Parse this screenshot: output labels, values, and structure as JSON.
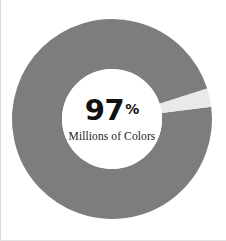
{
  "figure": {
    "background_color": "#ffffff",
    "width": 226,
    "height": 241
  },
  "center": {
    "value_number": "97",
    "value_unit": "%",
    "caption": "Millions of Colors"
  },
  "chart_data": {
    "type": "pie",
    "variant": "donut",
    "title": "",
    "subtitle": "",
    "xlabel": "",
    "ylabel": "",
    "center_text": "97%",
    "center_subtext": "Millions of Colors",
    "units": "percent",
    "total": 100,
    "legend": "none",
    "grid": false,
    "start_angle_deg": -7,
    "direction": "clockwise",
    "inner_radius_px": 50,
    "outer_radius_px": 100,
    "center_x_px": 112,
    "center_y_px": 119,
    "labels": [
      "Millions of Colors",
      "Remainder"
    ],
    "values": [
      97,
      3
    ],
    "colors": [
      "#7d7d7d",
      "#e9e9e9"
    ],
    "slices": [
      {
        "label": "Millions of Colors",
        "value": 97,
        "percent": 97,
        "color": "#7d7d7d",
        "start_angle_deg": -7,
        "end_angle_deg": 342.2
      },
      {
        "label": "Remainder",
        "value": 3,
        "percent": 3,
        "color": "#e9e9e9",
        "start_angle_deg": 342.2,
        "end_angle_deg": 353
      }
    ]
  },
  "colors": {
    "primary_segment": "#7d7d7d",
    "secondary_segment": "#e9e9e9",
    "center_hole": "#ffffff",
    "text": "#111111",
    "edge_rule": "#d9d9d9"
  }
}
